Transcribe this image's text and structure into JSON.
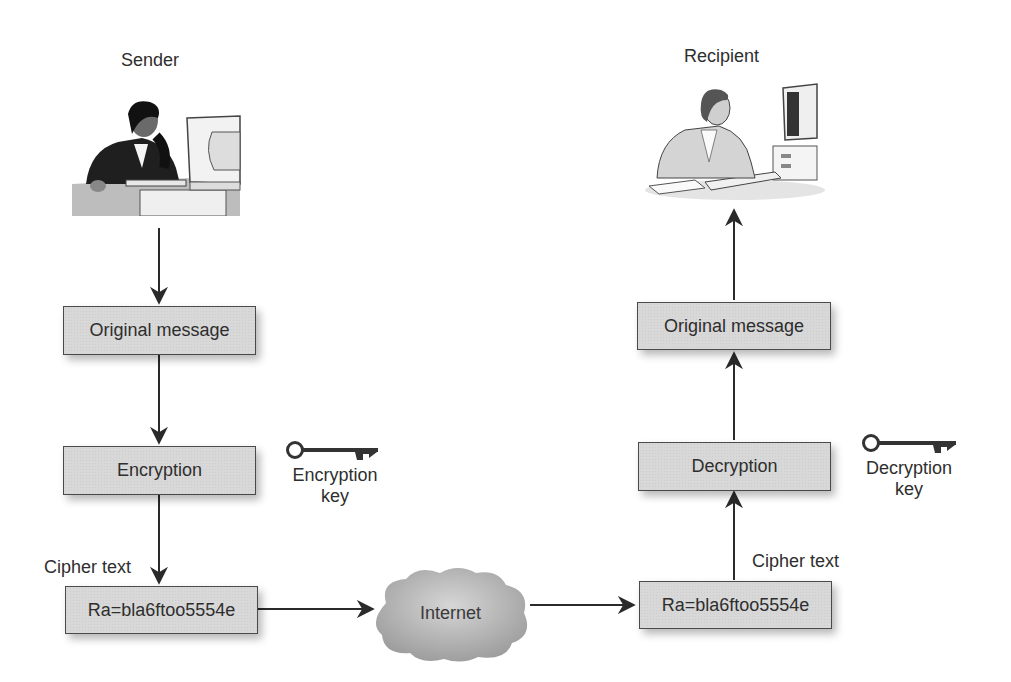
{
  "sender": {
    "title": "Sender",
    "illustration": "woman-at-computer"
  },
  "recipient": {
    "title": "Recipient",
    "illustration": "woman-at-computer"
  },
  "left_flow": {
    "original_message": "Original message",
    "encryption": "Encryption",
    "cipher_label": "Cipher text",
    "cipher_value": "Ra=bla6ftoo5554e",
    "key_label_line1": "Encryption",
    "key_label_line2": "key",
    "key_icon": "key-icon"
  },
  "network": {
    "label": "Internet",
    "icon": "cloud-icon"
  },
  "right_flow": {
    "original_message": "Original message",
    "decryption": "Decryption",
    "cipher_label": "Cipher text",
    "cipher_value": "Ra=bla6ftoo5554e",
    "key_label_line1": "Decryption",
    "key_label_line2": "key",
    "key_icon": "key-icon"
  },
  "colors": {
    "box_fill": "#d8d8d8",
    "box_border": "#4a4a4a",
    "arrow": "#2a2a2a",
    "cloud": "#a8a8a8"
  }
}
